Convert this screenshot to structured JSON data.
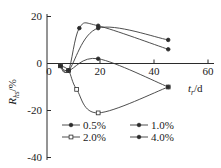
{
  "chart_data": {
    "type": "line",
    "title": "",
    "xlabel": "t_r/d",
    "ylabel": "R_hs/%",
    "xlim": [
      0,
      62
    ],
    "ylim": [
      -40,
      22
    ],
    "xticks": [
      "0",
      "20",
      "40",
      "60"
    ],
    "xtick_values": [
      0,
      20,
      40,
      60
    ],
    "yticks": [
      "20",
      "0",
      "-20",
      "-40"
    ],
    "ytick_values": [
      20,
      0,
      -20,
      -40
    ],
    "grid": false,
    "legend_position": "inside-lower-center",
    "series": [
      {
        "name": "0.5%",
        "marker": "filled-circle",
        "x": [
          5,
          8,
          12,
          19,
          45
        ],
        "y": [
          0,
          -2,
          16,
          17,
          7
        ]
      },
      {
        "name": "1.0%",
        "marker": "filled-circle",
        "x": [
          5,
          8,
          19,
          45
        ],
        "y": [
          0,
          -2,
          16,
          11
        ]
      },
      {
        "name": "2.0%",
        "marker": "open-square",
        "x": [
          5,
          8,
          11,
          19,
          45
        ],
        "y": [
          0,
          -2,
          -10,
          -20,
          -9
        ]
      },
      {
        "name": "4.0%",
        "marker": "filled-circle",
        "x": [
          5,
          8,
          19,
          45
        ],
        "y": [
          0,
          -2,
          3,
          -9
        ]
      }
    ],
    "legend": [
      {
        "label": "0.5%",
        "marker": "filled-circle"
      },
      {
        "label": "1.0%",
        "marker": "filled-circle"
      },
      {
        "label": "2.0%",
        "marker": "open-square"
      },
      {
        "label": "4.0%",
        "marker": "filled-circle"
      }
    ],
    "axis_label_parts": {
      "y_main": "R",
      "y_sub": "hs",
      "y_unit": "/%",
      "x_main": "t",
      "x_sub": "r",
      "x_unit": "/d"
    },
    "colors": {
      "axis": "#2b2b2b",
      "curve": "#3a3a3a",
      "background": "#ffffff"
    }
  }
}
